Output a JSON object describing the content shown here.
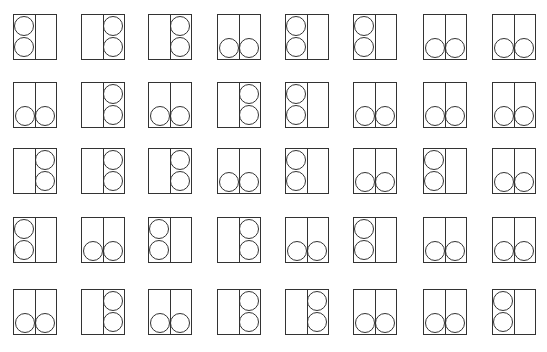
{
  "figure": {
    "rows": 5,
    "columns": 8,
    "line_color": "#333333",
    "background": "#ffffff",
    "legend": {
      "L": "two circles stacked vertically in left half",
      "R": "two circles stacked vertically in right half",
      "B": "two circles side by side at bottom, one in each half"
    },
    "grid": [
      [
        "L",
        "R",
        "R",
        "B",
        "L",
        "L",
        "B",
        "B"
      ],
      [
        "B",
        "R",
        "B",
        "R",
        "L",
        "B",
        "B",
        "B"
      ],
      [
        "R",
        "R",
        "R",
        "B",
        "L",
        "B",
        "L",
        "B"
      ],
      [
        "L",
        "B",
        "L",
        "R",
        "B",
        "L",
        "B",
        "B"
      ],
      [
        "B",
        "R",
        "B",
        "R",
        "R",
        "B",
        "B",
        "L"
      ]
    ],
    "column_x": [
      13,
      81,
      148,
      217,
      285,
      353,
      423,
      492
    ],
    "row_y": [
      14,
      82,
      148,
      217,
      289
    ],
    "cell_width": 44,
    "cell_height": 46
  }
}
